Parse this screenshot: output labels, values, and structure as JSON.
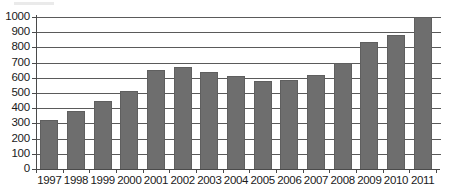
{
  "chart_data": {
    "type": "bar",
    "title": "",
    "subtitle": "",
    "xlabel": "",
    "ylabel": "",
    "categories": [
      "1997",
      "1998",
      "1999",
      "2000",
      "2001",
      "2002",
      "2003",
      "2004",
      "2005",
      "2006",
      "2007",
      "2008",
      "2009",
      "2010",
      "2011"
    ],
    "values": [
      320,
      380,
      450,
      510,
      650,
      670,
      640,
      610,
      580,
      585,
      620,
      695,
      835,
      880,
      1000
    ],
    "series": [
      {
        "name": "Series 1",
        "values": [
          320,
          380,
          450,
          510,
          650,
          670,
          640,
          610,
          580,
          585,
          620,
          695,
          835,
          880,
          1000
        ]
      }
    ],
    "ylim": [
      0,
      1000
    ],
    "ytick_labels": [
      "0",
      "100",
      "200",
      "300",
      "400",
      "500",
      "600",
      "700",
      "800",
      "900",
      "1000"
    ],
    "ytick_values": [
      0,
      100,
      200,
      300,
      400,
      500,
      600,
      700,
      800,
      900,
      1000
    ],
    "ytick_step": 100,
    "grid": true,
    "grid_axis": "y",
    "legend": false,
    "legend_position": "none",
    "annotations": [],
    "colors": {
      "bar_fill": "#6e6e6e",
      "bar_edge": "#5f5f5f",
      "gridline": "#5a5a5a",
      "axis": "#4a4a4a",
      "tick_label": "#1a1a1a",
      "background": "#ffffff"
    }
  }
}
